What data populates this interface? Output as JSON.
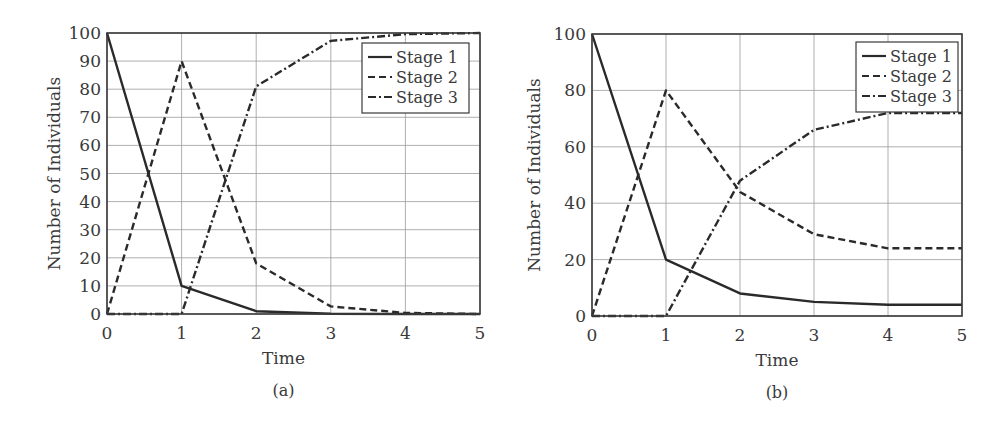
{
  "chart_data": [
    {
      "type": "line",
      "panel_label": "(a)",
      "title": "",
      "xlabel": "Time",
      "ylabel": "Number of Individuals",
      "x": [
        0,
        1,
        2,
        3,
        4,
        5
      ],
      "xlim": [
        0,
        5
      ],
      "ylim": [
        0,
        100
      ],
      "xticks": [
        0,
        1,
        2,
        3,
        4,
        5
      ],
      "yticks": [
        0,
        10,
        20,
        30,
        40,
        50,
        60,
        70,
        80,
        90,
        100
      ],
      "grid": true,
      "legend_position": "upper right",
      "series": [
        {
          "name": "Stage 1",
          "style": "solid",
          "values": [
            100,
            10,
            1,
            0.1,
            0,
            0
          ]
        },
        {
          "name": "Stage 2",
          "style": "dashed",
          "values": [
            0,
            90,
            18,
            2.7,
            0.4,
            0
          ]
        },
        {
          "name": "Stage 3",
          "style": "dashdot",
          "values": [
            0,
            0,
            81,
            97.2,
            99.6,
            100
          ]
        }
      ]
    },
    {
      "type": "line",
      "panel_label": "(b)",
      "title": "",
      "xlabel": "Time",
      "ylabel": "Number of Individuals",
      "x": [
        0,
        1,
        2,
        3,
        4,
        5
      ],
      "xlim": [
        0,
        5
      ],
      "ylim": [
        0,
        100
      ],
      "xticks": [
        0,
        1,
        2,
        3,
        4,
        5
      ],
      "yticks": [
        0,
        20,
        40,
        60,
        80,
        100
      ],
      "grid": true,
      "legend_position": "upper right",
      "series": [
        {
          "name": "Stage 1",
          "style": "solid",
          "values": [
            100,
            20,
            8,
            5,
            4,
            4
          ]
        },
        {
          "name": "Stage 2",
          "style": "dashed",
          "values": [
            0,
            80,
            44,
            29,
            24,
            24
          ]
        },
        {
          "name": "Stage 3",
          "style": "dashdot",
          "values": [
            0,
            0,
            48,
            66,
            72,
            72
          ]
        }
      ]
    }
  ],
  "layout": [
    {
      "left": 107,
      "top": 33,
      "right": 480,
      "bottom": 314,
      "ylabel_x": 60,
      "legend": {
        "x": 362,
        "y": 43,
        "w": 107,
        "h": 70
      }
    },
    {
      "left": 592,
      "top": 34,
      "right": 962,
      "bottom": 316,
      "ylabel_x": 540,
      "legend": {
        "x": 856,
        "y": 42,
        "w": 102,
        "h": 70
      }
    }
  ]
}
